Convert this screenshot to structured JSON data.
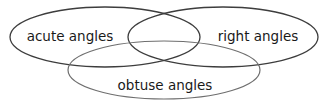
{
  "figure": {
    "type": "venn-diagram",
    "background_color": "#ffffff",
    "width": 328,
    "height": 107
  },
  "sets": [
    {
      "id": "acute",
      "label": "acute angles",
      "position": "top-left",
      "stroke_color": "#3d3d3d",
      "stroke_width": 1.3,
      "cx": 105,
      "cy": 37,
      "rx": 95,
      "ry": 30,
      "label_x": 70,
      "label_y": 37
    },
    {
      "id": "right",
      "label": "right angles",
      "position": "top-right",
      "stroke_color": "#3d3d3d",
      "stroke_width": 1.3,
      "cx": 223,
      "cy": 37,
      "rx": 95,
      "ry": 30,
      "label_x": 258,
      "label_y": 37
    },
    {
      "id": "obtuse",
      "label": "obtuse angles",
      "position": "bottom-center",
      "stroke_color": "#6e6e6e",
      "stroke_width": 1.2,
      "cx": 164,
      "cy": 70,
      "rx": 96,
      "ry": 29,
      "label_x": 165,
      "label_y": 86
    }
  ],
  "colors": {
    "background": "#ffffff",
    "stroke_dark": "#3d3d3d",
    "stroke_light": "#6e6e6e",
    "text": "#1a1a1a"
  }
}
